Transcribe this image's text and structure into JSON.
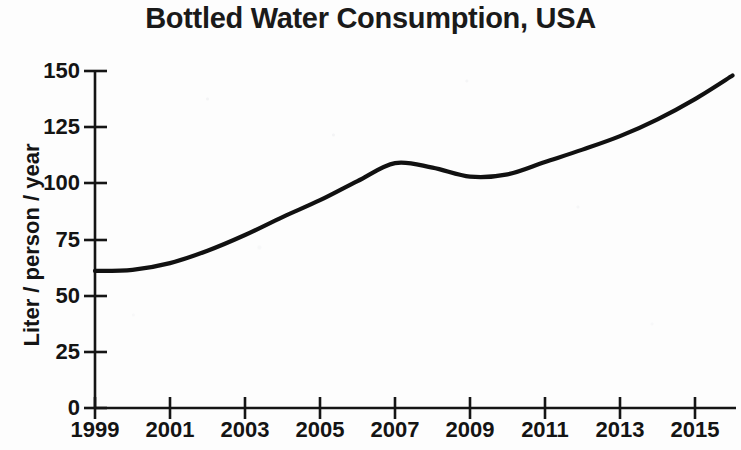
{
  "chart_data": {
    "type": "line",
    "title": "Bottled Water Consumption, USA",
    "xlabel": "",
    "ylabel": "Liter / person / year",
    "xlim": [
      1999,
      2016.3
    ],
    "ylim": [
      0,
      150
    ],
    "grid": false,
    "legend": "none",
    "line_color": "#111111",
    "x_tick_labels": [
      "1999",
      "2001",
      "2003",
      "2005",
      "2007",
      "2009",
      "2011",
      "2013",
      "2015"
    ],
    "x_ticks": [
      1999,
      2001,
      2003,
      2005,
      2007,
      2009,
      2011,
      2013,
      2015
    ],
    "y_tick_labels": [
      "0",
      "25",
      "50",
      "75",
      "100",
      "125",
      "150"
    ],
    "y_ticks": [
      0,
      25,
      50,
      75,
      100,
      125,
      150
    ],
    "x": [
      1999,
      2000,
      2001,
      2002,
      2003,
      2004,
      2005,
      2006,
      2007,
      2008,
      2009,
      2010,
      2011,
      2012,
      2013,
      2014,
      2015,
      2016
    ],
    "values": [
      61,
      61.5,
      64.5,
      70,
      77,
      85,
      92.5,
      101,
      109,
      107,
      103,
      104,
      109.5,
      115,
      121,
      128.5,
      137.5,
      148
    ]
  }
}
